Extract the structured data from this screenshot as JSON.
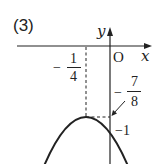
{
  "problem_label": "(3)",
  "axes": {
    "x_label": "x",
    "y_label": "y",
    "origin_label": "O"
  },
  "annotations": {
    "vertex_x": {
      "sign": "−",
      "numerator": "1",
      "denominator": "4"
    },
    "vertex_y": {
      "sign": "−",
      "numerator": "7",
      "denominator": "8"
    },
    "y_intercept": "−1"
  },
  "curve": {
    "type": "downward parabola",
    "vertex": "(−1/4, −7/8)",
    "y_intercept": "−1"
  },
  "colors": {
    "ink": "#222222",
    "background": "#ffffff"
  }
}
